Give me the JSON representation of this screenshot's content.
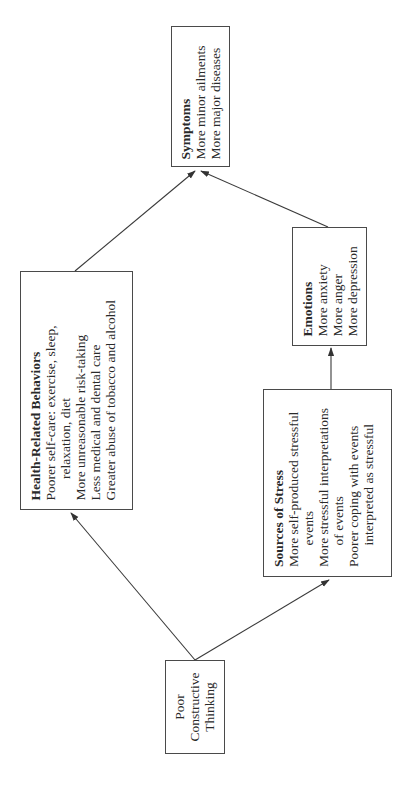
{
  "diagram": {
    "orientation": "rotated-90-ccw",
    "nodes": {
      "poor_thinking": {
        "lines": [
          "Poor",
          "Constructive",
          "Thinking"
        ]
      },
      "health_behaviors": {
        "title": "Health-Related Behaviors",
        "items": [
          {
            "text": "Poorer self-care: exercise, sleep,",
            "indent": false
          },
          {
            "text": "relaxation, diet",
            "indent": true
          },
          {
            "text": "More unreasonable risk-taking",
            "indent": false
          },
          {
            "text": "Less medical and dental care",
            "indent": false
          },
          {
            "text": "Greater abuse of tobacco and alcohol",
            "indent": false
          }
        ]
      },
      "sources_of_stress": {
        "title": "Sources of Stress",
        "items": [
          {
            "text": "More self-produced stressful",
            "indent": false
          },
          {
            "text": "events",
            "indent": true
          },
          {
            "text": "More stressful interpretations",
            "indent": false
          },
          {
            "text": "of events",
            "indent": true
          },
          {
            "text": "Poorer coping with events",
            "indent": false
          },
          {
            "text": "interpreted as stressful",
            "indent": true
          }
        ]
      },
      "emotions": {
        "title": "Emotions",
        "items": [
          "More anxiety",
          "More anger",
          "More depression"
        ]
      },
      "symptoms": {
        "title": "Symptoms",
        "items": [
          "More minor ailments",
          "More major diseases"
        ]
      }
    },
    "edges": [
      {
        "from": "Poor Constructive Thinking",
        "to": "Health-Related Behaviors"
      },
      {
        "from": "Poor Constructive Thinking",
        "to": "Sources of Stress"
      },
      {
        "from": "Sources of Stress",
        "to": "Emotions"
      },
      {
        "from": "Health-Related Behaviors",
        "to": "Symptoms"
      },
      {
        "from": "Emotions",
        "to": "Symptoms"
      }
    ],
    "colors": {
      "stroke": "#3a3a3a",
      "text": "#2a2a2a",
      "background": "#ffffff"
    }
  }
}
